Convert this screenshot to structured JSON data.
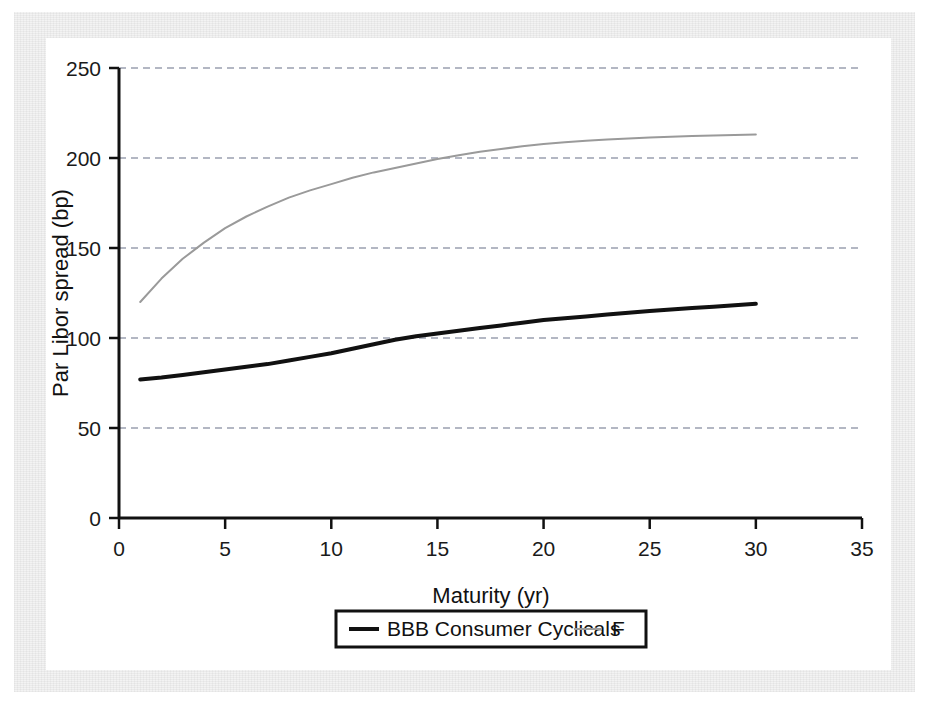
{
  "chart_data": {
    "type": "line",
    "title": "",
    "xlabel": "Maturity (yr)",
    "ylabel": "Par Libor spread (bp)",
    "xlim": [
      0,
      35
    ],
    "ylim": [
      0,
      250
    ],
    "xticks": [
      0,
      5,
      10,
      15,
      20,
      25,
      30,
      35
    ],
    "yticks": [
      0,
      50,
      100,
      150,
      200,
      250
    ],
    "xtick_labels": [
      "0",
      "5",
      "10",
      "15",
      "20",
      "25",
      "30",
      "35"
    ],
    "ytick_labels": [
      "0",
      "50",
      "100",
      "150",
      "200",
      "250"
    ],
    "grid": "horizontal-dashed",
    "legend_position": "bottom-center",
    "x": [
      1,
      2,
      3,
      4,
      5,
      6,
      7,
      8,
      9,
      10,
      11,
      12,
      13,
      14,
      15,
      16,
      17,
      18,
      19,
      20,
      21,
      22,
      23,
      24,
      25,
      26,
      27,
      28,
      29,
      30
    ],
    "series": [
      {
        "name": "BBB Consumer Cyclicals",
        "color": "#111111",
        "width": 4,
        "style": "solid",
        "values": [
          77,
          78,
          79.5,
          81,
          82.5,
          84,
          85.5,
          87.5,
          89.5,
          91.5,
          94,
          96.5,
          99,
          101,
          102.5,
          104,
          105.5,
          107,
          108.5,
          110,
          111,
          112,
          113,
          114,
          115,
          115.8,
          116.6,
          117.4,
          118.2,
          119
        ]
      },
      {
        "name": "F",
        "color": "#9a9a9a",
        "width": 2,
        "style": "solid",
        "values": [
          120,
          133,
          144,
          153,
          161,
          167.5,
          173,
          178,
          182,
          185.5,
          189,
          192,
          194.5,
          197,
          199.5,
          201.5,
          203.5,
          205,
          206.5,
          207.8,
          208.8,
          209.6,
          210.3,
          210.9,
          211.4,
          211.8,
          212.2,
          212.5,
          212.8,
          213
        ]
      }
    ]
  },
  "legend": {
    "entries": [
      {
        "label": "BBB Consumer Cyclicals",
        "swatch": "thick-black-line"
      },
      {
        "label": "F",
        "swatch": "thin-gray-line"
      }
    ]
  },
  "colors": {
    "axis": "#111111",
    "grid": "#9aa0b0",
    "series_primary": "#111111",
    "series_secondary": "#9a9a9a",
    "canvas": "#ffffff",
    "mat": "#f3f3f3"
  }
}
